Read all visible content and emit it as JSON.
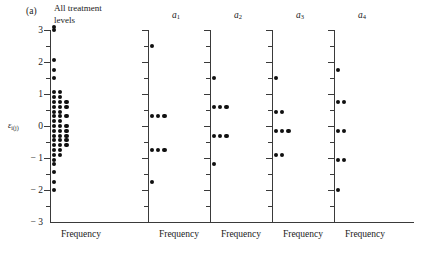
{
  "figure": {
    "label": "(a)",
    "y_axis_caption_epsilon": "ε",
    "y_axis_caption_sub": "i(j)"
  },
  "chart_data": {
    "type": "scatter",
    "title": "(a)",
    "xlabel": "Frequency",
    "ylabel": "ε i(j)",
    "ylim": [
      -3,
      3
    ],
    "yticks": [
      -3,
      -2,
      -1,
      0,
      1,
      2,
      3
    ],
    "ytick_labels": [
      "− 3",
      "− 2",
      "− 1",
      "0",
      "1",
      "2",
      "3"
    ],
    "yminor_ticks": [
      -2.5,
      -1.5,
      -0.5,
      0.5,
      1.5,
      2.5
    ],
    "grid": false,
    "legend": "none",
    "panels": [
      {
        "name": "all-treatment-levels",
        "title": "All treatment\nlevels",
        "xlabel": "Frequency",
        "values": [
          3.1,
          3.0,
          2.05,
          1.75,
          1.5,
          1.05,
          1.05,
          0.9,
          0.9,
          0.75,
          0.75,
          0.75,
          0.6,
          0.6,
          0.6,
          0.45,
          0.45,
          0.3,
          0.3,
          0.3,
          0.15,
          0.15,
          0.0,
          0.0,
          0.0,
          -0.15,
          -0.15,
          -0.15,
          -0.3,
          -0.3,
          -0.3,
          -0.45,
          -0.45,
          -0.45,
          -0.6,
          -0.6,
          -0.6,
          -0.75,
          -0.75,
          -0.9,
          -0.9,
          -1.05,
          -1.2,
          -1.45,
          -1.75,
          -2.0
        ],
        "counts_by_value": [
          {
            "value": 3.1,
            "count": 1
          },
          {
            "value": 3.0,
            "count": 1
          },
          {
            "value": 2.05,
            "count": 1
          },
          {
            "value": 1.75,
            "count": 1
          },
          {
            "value": 1.5,
            "count": 1
          },
          {
            "value": 1.05,
            "count": 2
          },
          {
            "value": 0.9,
            "count": 2
          },
          {
            "value": 0.75,
            "count": 3
          },
          {
            "value": 0.6,
            "count": 3
          },
          {
            "value": 0.45,
            "count": 2
          },
          {
            "value": 0.3,
            "count": 3
          },
          {
            "value": 0.15,
            "count": 2
          },
          {
            "value": 0.0,
            "count": 3
          },
          {
            "value": -0.15,
            "count": 3
          },
          {
            "value": -0.3,
            "count": 3
          },
          {
            "value": -0.45,
            "count": 3
          },
          {
            "value": -0.6,
            "count": 3
          },
          {
            "value": -0.75,
            "count": 2
          },
          {
            "value": -0.9,
            "count": 2
          },
          {
            "value": -1.05,
            "count": 1
          },
          {
            "value": -1.2,
            "count": 1
          },
          {
            "value": -1.45,
            "count": 1
          },
          {
            "value": -1.75,
            "count": 1
          },
          {
            "value": -2.0,
            "count": 1
          }
        ]
      },
      {
        "name": "a1",
        "title": "a",
        "title_sub": "1",
        "xlabel": "Frequency",
        "counts_by_value": [
          {
            "value": 2.5,
            "count": 1
          },
          {
            "value": 0.3,
            "count": 3
          },
          {
            "value": -0.75,
            "count": 3
          },
          {
            "value": -1.75,
            "count": 1
          }
        ]
      },
      {
        "name": "a2",
        "title": "a",
        "title_sub": "2",
        "xlabel": "Frequency",
        "counts_by_value": [
          {
            "value": 1.5,
            "count": 1
          },
          {
            "value": 0.6,
            "count": 3
          },
          {
            "value": -0.3,
            "count": 3
          },
          {
            "value": -1.2,
            "count": 1
          }
        ]
      },
      {
        "name": "a3",
        "title": "a",
        "title_sub": "3",
        "xlabel": "Frequency",
        "counts_by_value": [
          {
            "value": 1.5,
            "count": 1
          },
          {
            "value": 0.45,
            "count": 2
          },
          {
            "value": -0.15,
            "count": 3
          },
          {
            "value": -0.9,
            "count": 2
          }
        ]
      },
      {
        "name": "a4",
        "title": "a",
        "title_sub": "4",
        "xlabel": "Frequency",
        "counts_by_value": [
          {
            "value": 1.75,
            "count": 1
          },
          {
            "value": 0.75,
            "count": 2
          },
          {
            "value": -0.15,
            "count": 2
          },
          {
            "value": -1.05,
            "count": 2
          },
          {
            "value": -2.0,
            "count": 1
          }
        ]
      }
    ]
  }
}
